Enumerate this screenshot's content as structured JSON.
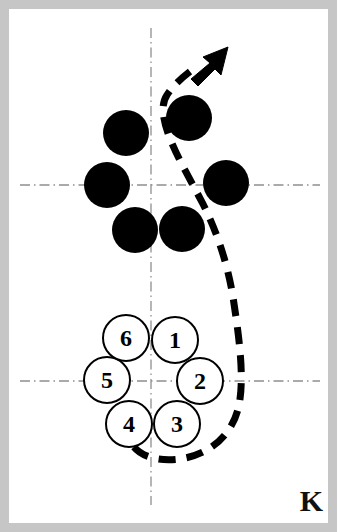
{
  "figure": {
    "panel_label": "K",
    "width": 337,
    "height": 532,
    "background_color": "#ffffff",
    "frame_color": "#c6c6c6",
    "ink_color": "#000000",
    "axis_color": "#8c8c8c"
  },
  "axes": {
    "vertical_line": {
      "x": 151,
      "y1": 28,
      "y2": 505,
      "style": "dash-dot"
    },
    "horizontal_line_upper": {
      "y": 185,
      "x1": 20,
      "x2": 320,
      "style": "dash-dot"
    },
    "horizontal_line_lower": {
      "y": 381,
      "x1": 20,
      "x2": 320,
      "style": "dash-dot"
    }
  },
  "filled_discs": [
    {
      "name": "disc-upper-left",
      "cx": 126,
      "cy": 133,
      "r": 23
    },
    {
      "name": "disc-upper-right",
      "cx": 189,
      "cy": 118,
      "r": 23
    },
    {
      "name": "disc-middle-left",
      "cx": 107,
      "cy": 185,
      "r": 23
    },
    {
      "name": "disc-middle-right",
      "cx": 226,
      "cy": 183,
      "r": 23
    },
    {
      "name": "disc-lower-left",
      "cx": 135,
      "cy": 230,
      "r": 23
    },
    {
      "name": "disc-lower-right",
      "cx": 182,
      "cy": 229,
      "r": 23
    }
  ],
  "numbered_circles": [
    {
      "label": "1",
      "cx": 175,
      "cy": 340,
      "r": 23
    },
    {
      "label": "2",
      "cx": 200,
      "cy": 381,
      "r": 23
    },
    {
      "label": "3",
      "cx": 177,
      "cy": 424,
      "r": 23
    },
    {
      "label": "4",
      "cx": 129,
      "cy": 424,
      "r": 23
    },
    {
      "label": "5",
      "cx": 107,
      "cy": 380,
      "r": 23
    },
    {
      "label": "6",
      "cx": 126,
      "cy": 338,
      "r": 23
    }
  ],
  "trajectory": {
    "name": "dashed-trajectory",
    "style": "dashed",
    "stroke_width": 7,
    "dash_pattern": "17 11",
    "path": "M 134 447 C 147 463 181 462 203 452 C 224 442 236 423 239 400 C 243 372 238 330 233 298 C 227 263 216 231 203 205 C 191 180 178 158 170 137 C 163 118 162 105 167 96 C 172 86 186 75 196 68",
    "arrow_tip": {
      "x": 228,
      "y": 48
    },
    "arrow_angle_deg": -45
  }
}
